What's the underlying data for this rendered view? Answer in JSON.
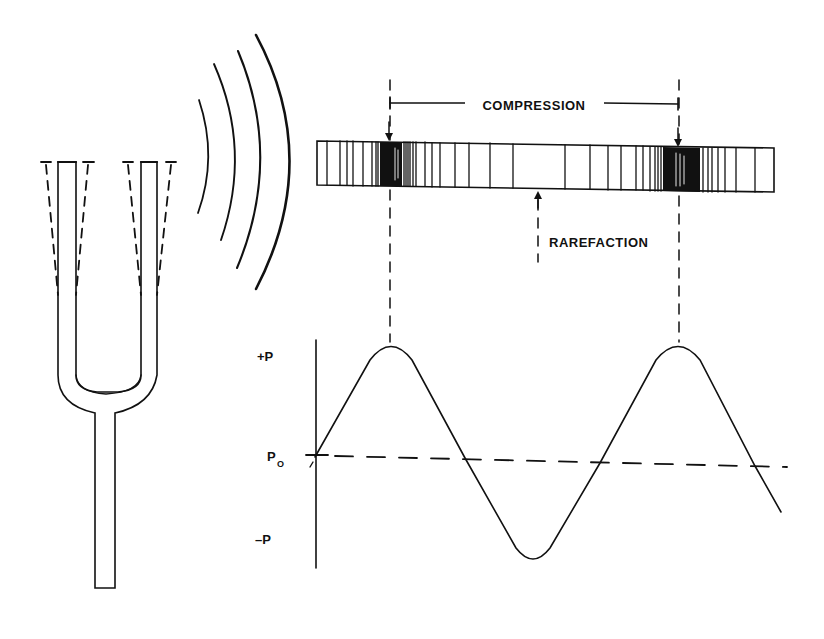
{
  "figure": {
    "labels": {
      "compression": "COMPRESSION",
      "rarefaction": "RAREFACTION",
      "plus_p": "+P",
      "p0_main": "P",
      "p0_sub": "O",
      "minus_p": "–P"
    },
    "ink_color": "#111111",
    "background": "#ffffff"
  },
  "tuning_fork": {
    "description": "tuning fork with dashed prong vibration envelopes"
  },
  "sound_waves": {
    "arc_count": 4
  },
  "air_column": {
    "description": "band showing air molecule density; dense regions are compressions, sparse center is rarefaction",
    "compression_positions_x": [
      390,
      679
    ],
    "rarefaction_position_x": 538
  },
  "pressure_graph": {
    "y_axis_labels": [
      "+P",
      "P0",
      "-P"
    ],
    "wave": "pressure vs position, sinusoidal about ambient pressure P0",
    "peaks": 2,
    "troughs": 1
  }
}
